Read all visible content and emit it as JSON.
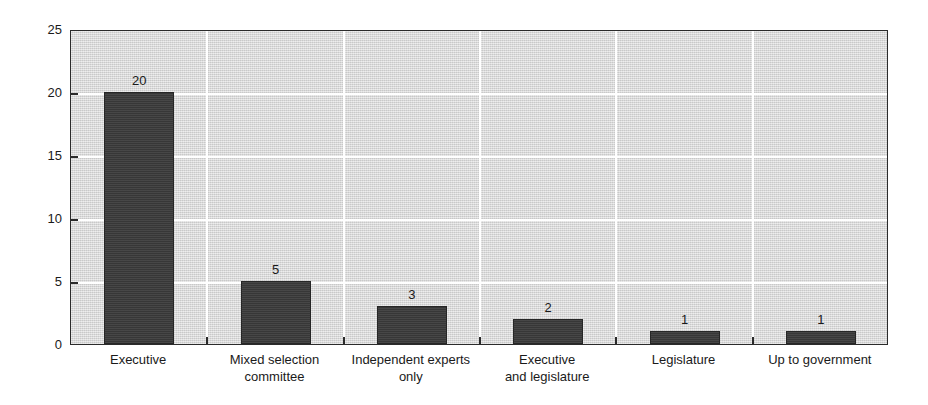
{
  "chart_data": {
    "type": "bar",
    "title": "",
    "subtitle": "",
    "xlabel": "",
    "ylabel": "",
    "ylim": [
      0,
      25
    ],
    "yticks": [
      0,
      5,
      10,
      15,
      20,
      25
    ],
    "ytick_labels": [
      "0",
      "5",
      "10",
      "15",
      "20",
      "25"
    ],
    "grid": "both",
    "legend": "none",
    "categories": [
      "Executive",
      "Mixed selection committee",
      "Independent experts only",
      "Executive and legislature",
      "Legislature",
      "Up to government"
    ],
    "category_label_lines": [
      [
        "Executive"
      ],
      [
        "Mixed selection",
        "committee"
      ],
      [
        "Independent experts",
        "only"
      ],
      [
        "Executive",
        "and legislature"
      ],
      [
        "Legislature"
      ],
      [
        "Up to government"
      ]
    ],
    "values": [
      20,
      5,
      3,
      2,
      1,
      1
    ],
    "value_labels": [
      "20",
      "5",
      "3",
      "2",
      "1",
      "1"
    ],
    "colors": {
      "bar_fill": "#3d3d3d",
      "bar_edge": "#262626",
      "plot_background": "#dcdcdc",
      "gridline": "#ffffff",
      "axis": "#2b2b2b",
      "text": "#1a1a1a",
      "figure_background": "#ffffff"
    }
  }
}
